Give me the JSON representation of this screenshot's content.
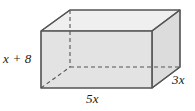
{
  "figure": {
    "name": "rectangular-prism-diagram",
    "shape": "rectangular prism",
    "colors": {
      "front_face": "#e3e3e3",
      "right_face": "#dcdcdc",
      "top_face": "#efefef",
      "edge": "#555555",
      "hidden_edge": "#555555",
      "label_text": "#1a1a1a",
      "background": "#ffffff"
    },
    "labels": {
      "height": "x + 8",
      "width": "5x",
      "depth": "3x"
    },
    "geometry": {
      "front_top_left": [
        41,
        31
      ],
      "front_top_right": [
        152,
        31
      ],
      "front_bottom_left": [
        41,
        88
      ],
      "front_bottom_right": [
        152,
        88
      ],
      "back_top_left": [
        70,
        10
      ],
      "back_top_right": [
        180,
        10
      ],
      "back_bottom_left": [
        70,
        67
      ],
      "back_bottom_right": [
        180,
        67
      ],
      "hidden_vertex": [
        70,
        67
      ]
    }
  }
}
